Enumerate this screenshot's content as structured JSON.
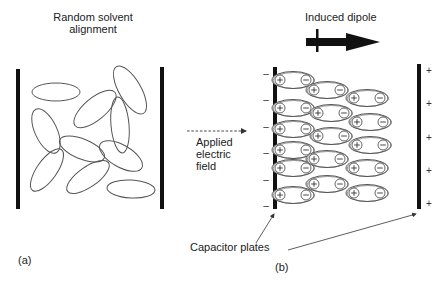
{
  "panel_a": {
    "title_line1": "Random solvent",
    "title_line2": "alignment",
    "caption": "(a)",
    "molecules": [
      {
        "cx": 56,
        "cy": 92,
        "rx": 24,
        "ry": 9,
        "rot": 0
      },
      {
        "cx": 95,
        "cy": 109,
        "rx": 26,
        "ry": 11,
        "rot": -40
      },
      {
        "cx": 130,
        "cy": 90,
        "rx": 27,
        "ry": 11,
        "rot": 60
      },
      {
        "cx": 120,
        "cy": 125,
        "rx": 28,
        "ry": 9,
        "rot": 85
      },
      {
        "cx": 46,
        "cy": 131,
        "rx": 24,
        "ry": 11,
        "rot": 65
      },
      {
        "cx": 82,
        "cy": 149,
        "rx": 24,
        "ry": 10,
        "rot": 22
      },
      {
        "cx": 121,
        "cy": 156,
        "rx": 24,
        "ry": 11,
        "rot": 30
      },
      {
        "cx": 47,
        "cy": 170,
        "rx": 25,
        "ry": 10,
        "rot": -55
      },
      {
        "cx": 88,
        "cy": 177,
        "rx": 25,
        "ry": 10,
        "rot": -35
      },
      {
        "cx": 131,
        "cy": 189,
        "rx": 24,
        "ry": 9,
        "rot": 3
      }
    ]
  },
  "middle": {
    "field_label_line1": "Applied",
    "field_label_line2": "electric",
    "field_label_line3": "field"
  },
  "panel_b": {
    "title": "Induced dipole",
    "caption": "(b)",
    "plates_label": "Capacitor plates",
    "left_plate_sign": "–",
    "right_plate_sign": "+",
    "dipole_plus": "+",
    "dipole_minus": "–",
    "dipoles": [
      {
        "cx": 293,
        "cy": 80
      },
      {
        "cx": 293,
        "cy": 108
      },
      {
        "cx": 293,
        "cy": 129
      },
      {
        "cx": 293,
        "cy": 150
      },
      {
        "cx": 293,
        "cy": 168
      },
      {
        "cx": 293,
        "cy": 195
      },
      {
        "cx": 327,
        "cy": 90
      },
      {
        "cx": 331,
        "cy": 113
      },
      {
        "cx": 331,
        "cy": 136
      },
      {
        "cx": 327,
        "cy": 159
      },
      {
        "cx": 327,
        "cy": 184
      },
      {
        "cx": 367,
        "cy": 98
      },
      {
        "cx": 370,
        "cy": 122
      },
      {
        "cx": 370,
        "cy": 145
      },
      {
        "cx": 367,
        "cy": 168
      },
      {
        "cx": 367,
        "cy": 193
      }
    ]
  },
  "colors": {
    "line": "#555555",
    "plate": "#111111",
    "text": "#222222"
  }
}
